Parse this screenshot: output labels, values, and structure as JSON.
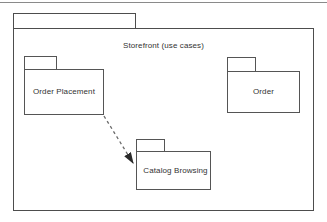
{
  "diagram": {
    "type": "uml-package-diagram",
    "title_visible": "Storefront (use cases)",
    "top_rule": {
      "present": true,
      "color": "#8a8a8a"
    },
    "outer_package": {
      "name": "outer-package",
      "label": "",
      "title_text": "Storefront (use cases)",
      "tab": {
        "x": 13,
        "y": 13,
        "width": 123,
        "height": 16
      },
      "body": {
        "x": 13,
        "y": 29,
        "width": 301,
        "height": 182
      },
      "stroke": "#4d4d4d",
      "fill": "#ffffff"
    },
    "packages": [
      {
        "id": "order-placement",
        "label": "Order Placement",
        "tab": {
          "x": 24,
          "y": 56,
          "width": 33,
          "height": 14
        },
        "body": {
          "x": 24,
          "y": 70,
          "width": 80,
          "height": 45
        },
        "label_x": 64,
        "label_y": 88,
        "stroke": "#555555",
        "fill": "#ffffff"
      },
      {
        "id": "order",
        "label": "Order",
        "tab": {
          "x": 227,
          "y": 57,
          "width": 29,
          "height": 15
        },
        "body": {
          "x": 227,
          "y": 72,
          "width": 73,
          "height": 41
        },
        "label_x": 263,
        "label_y": 88,
        "stroke": "#555555",
        "fill": "#ffffff"
      },
      {
        "id": "catalog-browsing",
        "label": "Catalog Browsing",
        "tab": {
          "x": 136,
          "y": 139,
          "width": 29,
          "height": 13
        },
        "body": {
          "x": 136,
          "y": 152,
          "width": 75,
          "height": 38
        },
        "label_x": 173,
        "label_y": 167,
        "stroke": "#555555",
        "fill": "#ffffff"
      }
    ],
    "dependencies": [
      {
        "id": "order-placement-to-catalog-browsing",
        "from": "order-placement",
        "to": "catalog-browsing",
        "style": "dashed",
        "arrowhead": "filled-triangle",
        "label": "",
        "x1": 104,
        "y1": 116,
        "x2": 136,
        "y2": 167,
        "stroke": "#6b6b6b",
        "dash": "3 3"
      }
    ]
  }
}
